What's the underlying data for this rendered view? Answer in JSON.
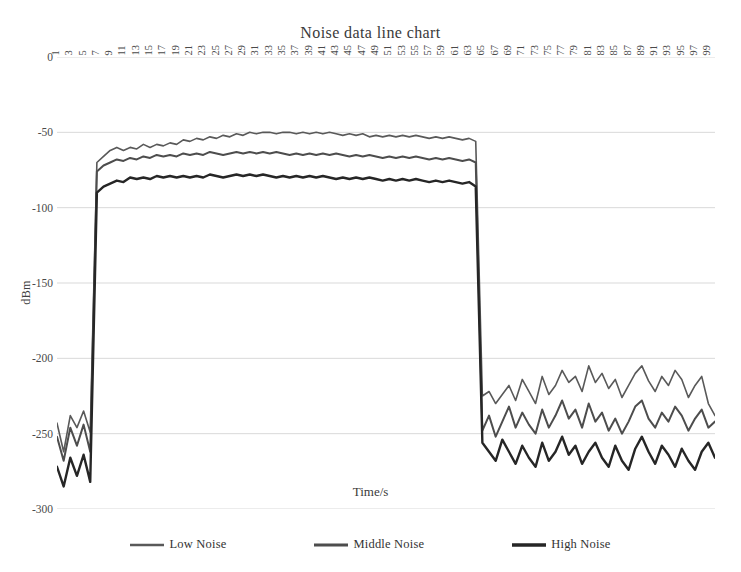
{
  "chart_data": {
    "type": "line",
    "title": "Noise data line chart",
    "xlabel": "Time/s",
    "ylabel": "dBm",
    "xlim": [
      1,
      100
    ],
    "ylim": [
      -300,
      0
    ],
    "grid": true,
    "grid_axis": "y",
    "legend_position": "bottom",
    "y_ticks": [
      0,
      -50,
      -100,
      -150,
      -200,
      -250,
      -300
    ],
    "x_ticks": [
      1,
      3,
      5,
      7,
      9,
      11,
      13,
      15,
      17,
      19,
      21,
      23,
      25,
      27,
      29,
      31,
      33,
      35,
      37,
      39,
      41,
      43,
      45,
      47,
      49,
      51,
      53,
      55,
      57,
      59,
      61,
      63,
      65,
      67,
      69,
      71,
      73,
      75,
      77,
      79,
      81,
      83,
      85,
      87,
      89,
      91,
      93,
      95,
      97,
      99
    ],
    "x": [
      1,
      2,
      3,
      4,
      5,
      6,
      7,
      8,
      9,
      10,
      11,
      12,
      13,
      14,
      15,
      16,
      17,
      18,
      19,
      20,
      21,
      22,
      23,
      24,
      25,
      26,
      27,
      28,
      29,
      30,
      31,
      32,
      33,
      34,
      35,
      36,
      37,
      38,
      39,
      40,
      41,
      42,
      43,
      44,
      45,
      46,
      47,
      48,
      49,
      50,
      51,
      52,
      53,
      54,
      55,
      56,
      57,
      58,
      59,
      60,
      61,
      62,
      63,
      64,
      65,
      66,
      67,
      68,
      69,
      70,
      71,
      72,
      73,
      74,
      75,
      76,
      77,
      78,
      79,
      80,
      81,
      82,
      83,
      84,
      85,
      86,
      87,
      88,
      89,
      90,
      91,
      92,
      93,
      94,
      95,
      96,
      97,
      98,
      99,
      100
    ],
    "series": [
      {
        "name": "Low Noise",
        "color": "#595959",
        "width": 1.6,
        "values": [
          -243,
          -262,
          -238,
          -246,
          -235,
          -249,
          -70,
          -66,
          -62,
          -60,
          -62,
          -60,
          -61,
          -58,
          -60,
          -58,
          -59,
          -57,
          -58,
          -55,
          -56,
          -54,
          -55,
          -53,
          -54,
          -52,
          -53,
          -51,
          -52,
          -50,
          -51,
          -50,
          -50,
          -51,
          -50,
          -50,
          -51,
          -50,
          -51,
          -50,
          -51,
          -50,
          -51,
          -52,
          -51,
          -52,
          -51,
          -53,
          -52,
          -53,
          -52,
          -53,
          -52,
          -53,
          -52,
          -53,
          -54,
          -53,
          -54,
          -53,
          -54,
          -55,
          -54,
          -56,
          -225,
          -222,
          -230,
          -224,
          -218,
          -228,
          -214,
          -222,
          -230,
          -212,
          -224,
          -218,
          -208,
          -216,
          -212,
          -222,
          -205,
          -216,
          -210,
          -220,
          -214,
          -226,
          -218,
          -210,
          -205,
          -215,
          -222,
          -212,
          -218,
          -208,
          -214,
          -226,
          -218,
          -212,
          -230,
          -238
        ]
      },
      {
        "name": "Middle Noise",
        "color": "#4d4d4d",
        "width": 2.0,
        "values": [
          -252,
          -268,
          -246,
          -258,
          -244,
          -262,
          -76,
          -72,
          -70,
          -68,
          -69,
          -67,
          -68,
          -66,
          -67,
          -65,
          -66,
          -65,
          -66,
          -64,
          -65,
          -64,
          -65,
          -63,
          -64,
          -65,
          -64,
          -63,
          -64,
          -63,
          -64,
          -63,
          -64,
          -63,
          -64,
          -65,
          -64,
          -65,
          -64,
          -65,
          -64,
          -65,
          -64,
          -65,
          -66,
          -65,
          -66,
          -65,
          -66,
          -67,
          -66,
          -67,
          -66,
          -67,
          -66,
          -67,
          -68,
          -67,
          -68,
          -67,
          -68,
          -69,
          -68,
          -70,
          -248,
          -238,
          -252,
          -242,
          -232,
          -246,
          -236,
          -244,
          -250,
          -234,
          -246,
          -238,
          -228,
          -240,
          -234,
          -246,
          -230,
          -242,
          -236,
          -248,
          -240,
          -250,
          -242,
          -232,
          -228,
          -240,
          -246,
          -236,
          -242,
          -232,
          -238,
          -248,
          -240,
          -234,
          -246,
          -242
        ]
      },
      {
        "name": "High Noise",
        "color": "#262626",
        "width": 2.4,
        "values": [
          -272,
          -285,
          -266,
          -278,
          -264,
          -282,
          -90,
          -86,
          -84,
          -82,
          -83,
          -80,
          -81,
          -80,
          -81,
          -79,
          -80,
          -79,
          -80,
          -79,
          -80,
          -79,
          -80,
          -78,
          -79,
          -80,
          -79,
          -78,
          -79,
          -78,
          -79,
          -78,
          -79,
          -80,
          -79,
          -80,
          -79,
          -80,
          -79,
          -80,
          -79,
          -80,
          -81,
          -80,
          -81,
          -80,
          -81,
          -80,
          -81,
          -82,
          -81,
          -82,
          -81,
          -82,
          -81,
          -82,
          -83,
          -82,
          -83,
          -82,
          -83,
          -84,
          -83,
          -86,
          -256,
          -262,
          -268,
          -254,
          -262,
          -270,
          -258,
          -266,
          -272,
          -256,
          -268,
          -262,
          -252,
          -264,
          -258,
          -270,
          -262,
          -256,
          -266,
          -272,
          -258,
          -268,
          -274,
          -260,
          -252,
          -262,
          -270,
          -258,
          -264,
          -272,
          -260,
          -268,
          -274,
          -262,
          -256,
          -266
        ]
      }
    ]
  },
  "axis": {
    "y_title": "dBm",
    "x_title": "Time/s"
  },
  "title": "Noise data line chart",
  "colors": {
    "grid": "#d9d9d9",
    "text": "#3a3a3a",
    "background": "#ffffff"
  }
}
